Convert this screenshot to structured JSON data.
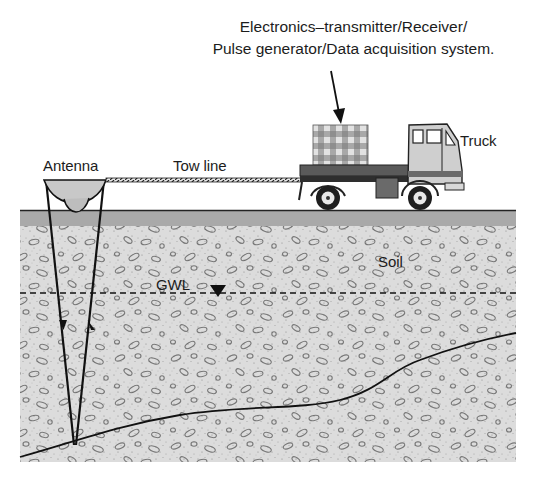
{
  "figure": {
    "title_lines": [
      "Electronics–transmitter/Receiver/",
      "Pulse generator/Data acquisition system."
    ],
    "labels": {
      "antenna": "Antenna",
      "tow_line": "Tow line",
      "truck": "Truck",
      "soil": "Soil",
      "gwl": "GWL"
    },
    "colors": {
      "background": "#ffffff",
      "soil_fill": "#dcdcdc",
      "surface_band": "#a9a9a9",
      "ink": "#111111",
      "truck_body": "#cfcfcf",
      "truck_dark": "#3a3a3a",
      "equipment_checker_light": "#e6e6e6",
      "equipment_checker_dark": "#9a9a9a"
    },
    "elements": [
      {
        "name": "electronics-box",
        "description": "checkered equipment box on truck bed"
      },
      {
        "name": "truck",
        "description": "flatbed truck carrying electronics"
      },
      {
        "name": "tow-line",
        "description": "hatched line connecting antenna to truck"
      },
      {
        "name": "antenna",
        "description": "bowl-shaped GPR antenna on ground surface"
      },
      {
        "name": "ray-paths",
        "description": "transmitted (down arrow) and reflected (up arrow) ray paths"
      },
      {
        "name": "gwl-line",
        "description": "dashed groundwater level line with inverted triangle marker"
      },
      {
        "name": "reflector",
        "description": "subsurface layer boundary curve"
      }
    ]
  }
}
